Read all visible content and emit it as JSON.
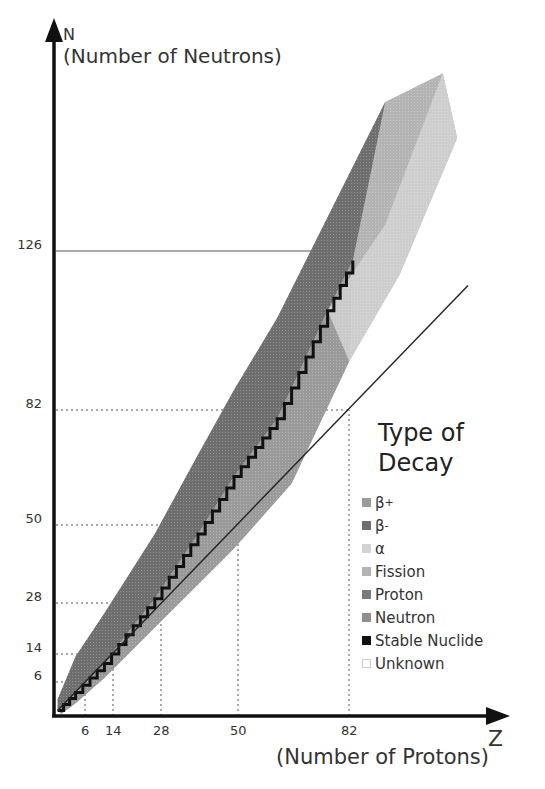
{
  "chart_data": {
    "type": "heatmap",
    "title": "Type of Decay",
    "xlabel": "Z",
    "xlabel_sub": "(Number of Protons)",
    "ylabel": "N",
    "ylabel_sub": "(Number of Neutrons)",
    "x_ticks": [
      6,
      14,
      28,
      50,
      82
    ],
    "y_ticks": [
      6,
      14,
      28,
      50,
      82,
      126
    ],
    "magic_numbers": [
      2,
      8,
      20,
      28,
      50,
      82,
      126
    ],
    "reference_line": "N = Z",
    "xlim": [
      0,
      125
    ],
    "ylim": [
      0,
      180
    ],
    "grid": "dashed lines at magic numbers",
    "legend": [
      {
        "label": "β+",
        "base": "β",
        "sup": "+",
        "color": "#9a9a9a"
      },
      {
        "label": "β-",
        "base": "β",
        "sup": "-",
        "color": "#6e6e6e"
      },
      {
        "label": "α",
        "base": "α",
        "sup": "",
        "color": "#d2d2d2"
      },
      {
        "label": "Fission",
        "base": "Fission",
        "sup": "",
        "color": "#b4b4b4"
      },
      {
        "label": "Proton",
        "base": "Proton",
        "sup": "",
        "color": "#7a7a7a"
      },
      {
        "label": "Neutron",
        "base": "Neutron",
        "sup": "",
        "color": "#8f8f8f"
      },
      {
        "label": "Stable Nuclide",
        "base": "Stable Nuclide",
        "sup": "",
        "color": "#111111"
      },
      {
        "label": "Unknown",
        "base": "Unknown",
        "sup": "",
        "color": "#ffffff"
      }
    ],
    "band": {
      "description": "Nuclide band; stable nuclides form a staircase between the upper (neutron-rich, β-) edge and lower (proton-rich, β+) edge",
      "upper_edge": [
        [
          1,
          4
        ],
        [
          6,
          16
        ],
        [
          14,
          28
        ],
        [
          28,
          50
        ],
        [
          40,
          72
        ],
        [
          50,
          90
        ],
        [
          62,
          110
        ],
        [
          82,
          150
        ],
        [
          92,
          170
        ],
        [
          108,
          178
        ]
      ],
      "lower_edge": [
        [
          2,
          0
        ],
        [
          6,
          3
        ],
        [
          14,
          10
        ],
        [
          28,
          24
        ],
        [
          40,
          36
        ],
        [
          50,
          46
        ],
        [
          66,
          64
        ],
        [
          82,
          98
        ],
        [
          96,
          122
        ],
        [
          112,
          160
        ]
      ],
      "stable_line": [
        [
          1,
          1
        ],
        [
          6,
          6
        ],
        [
          14,
          14
        ],
        [
          20,
          22
        ],
        [
          28,
          32
        ],
        [
          40,
          50
        ],
        [
          50,
          66
        ],
        [
          62,
          82
        ],
        [
          76,
          112
        ],
        [
          83,
          126
        ]
      ]
    }
  }
}
